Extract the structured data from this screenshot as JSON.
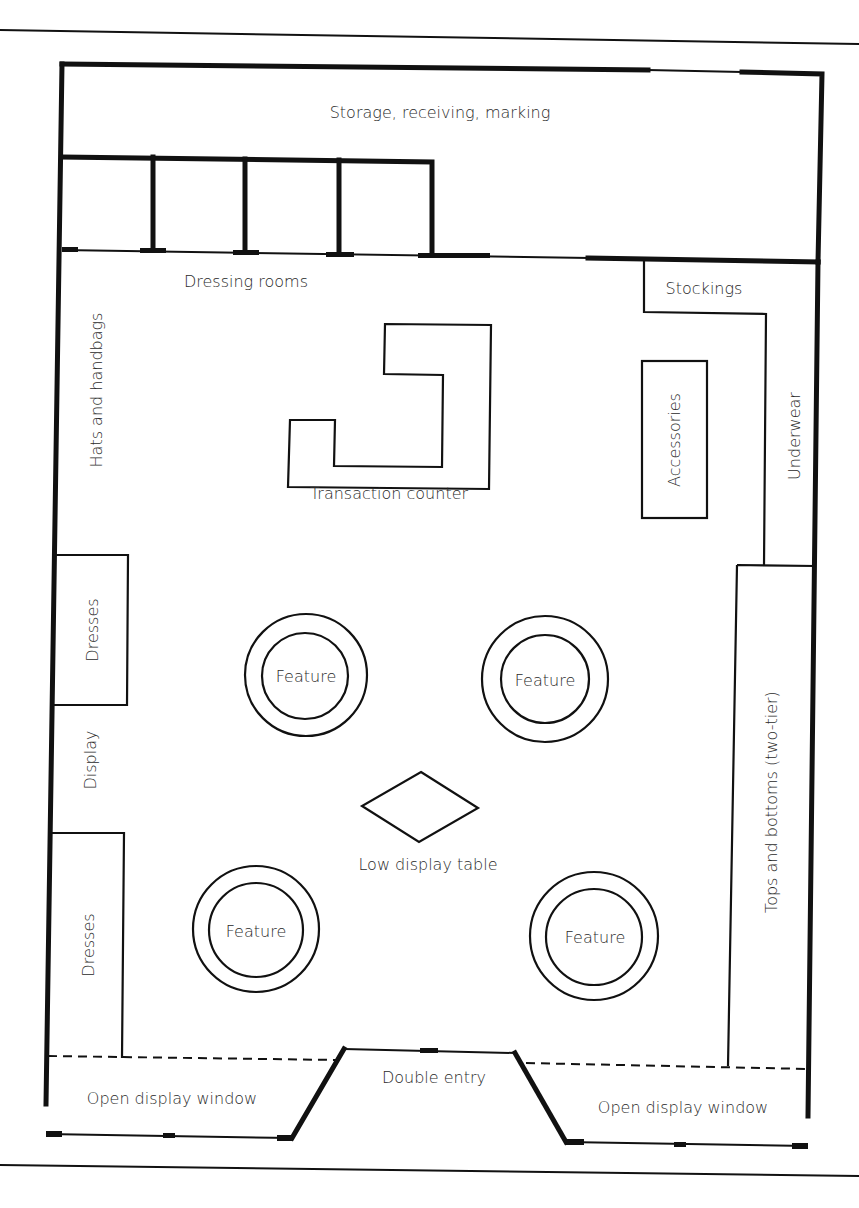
{
  "diagram": {
    "type": "store floor plan",
    "colors": {
      "line": "#111111",
      "text": "#2a2a2a",
      "background": "#ffffff"
    }
  },
  "areas": {
    "storage": "Storage, receiving, marking",
    "dressing_rooms": "Dressing rooms",
    "stockings": "Stockings",
    "hats_handbags": "Hats and handbags",
    "transaction_counter": "Transaction counter",
    "accessories": "Accessories",
    "underwear": "Underwear",
    "dresses_upper": "Dresses",
    "display": "Display",
    "dresses_lower": "Dresses",
    "tops_bottoms": "Tops and bottoms (two-tier)",
    "low_display_table": "Low display table",
    "double_entry": "Double entry",
    "open_window_left": "Open display window",
    "open_window_right": "Open display window"
  },
  "features": [
    {
      "label": "Feature"
    },
    {
      "label": "Feature"
    },
    {
      "label": "Feature"
    },
    {
      "label": "Feature"
    }
  ]
}
